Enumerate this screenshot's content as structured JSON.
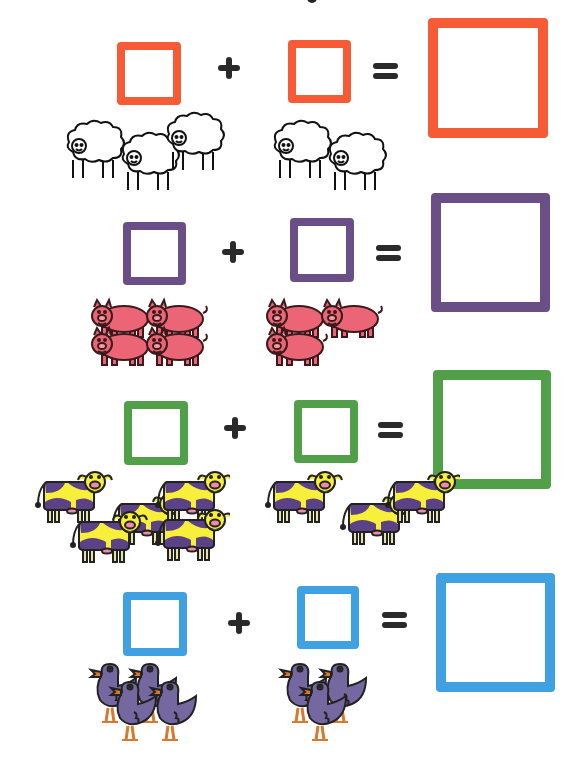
{
  "worksheet": {
    "type": "picture addition",
    "operator": "+",
    "equals": "=",
    "rows": [
      {
        "animal": "sheep",
        "left_count": 3,
        "right_count": 2,
        "color": "#F75B35",
        "fill": "#ffffff",
        "outline": "#111111"
      },
      {
        "animal": "pig",
        "left_count": 4,
        "right_count": 3,
        "color": "#6A4E86",
        "fill": "#EC6577",
        "outline": "#3a1a1a"
      },
      {
        "animal": "cow",
        "left_count": 5,
        "right_count": 3,
        "color": "#519F48",
        "fill": "#F7EF3A",
        "spot": "#5B4186",
        "outline": "#222222"
      },
      {
        "animal": "duck",
        "left_count": 4,
        "right_count": 3,
        "color": "#3FA0E2",
        "fill": "#75679F",
        "beak": "#D9782F",
        "outline": "#222222"
      }
    ]
  }
}
